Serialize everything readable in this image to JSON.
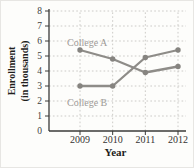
{
  "figure": {
    "background": "#fdfdfb",
    "border_color": "#e7e6e3",
    "axis_color": "#3a3a38",
    "grid_color": "#c6c5c2",
    "tick_label_color": "#403f3d",
    "axis_title_color": "#1f1e1c",
    "series_line_color": "#8e8c88",
    "marker_color": "#868480",
    "series_label_color": "#9d9b97"
  },
  "chart_data": {
    "type": "line",
    "title": "",
    "xlabel": "Year",
    "ylabel": "Enrollment (in thousands)",
    "ylabel_lines": [
      "Enrollment",
      "(in thousands)"
    ],
    "categories": [
      "2009",
      "2010",
      "2011",
      "2012"
    ],
    "series": [
      {
        "name": "College A",
        "values": [
          5.4,
          4.8,
          3.9,
          4.3
        ],
        "color": "#8e8c88"
      },
      {
        "name": "College B",
        "values": [
          3.0,
          3.0,
          4.9,
          5.4
        ],
        "color": "#8e8c88"
      }
    ],
    "ylim": [
      0,
      8
    ],
    "yticks": [
      0,
      1,
      2,
      3,
      4,
      5,
      6,
      7,
      8
    ],
    "ytick_step": 1,
    "grid": "dotted",
    "legend_position": "inline-labels",
    "marker": "circle"
  }
}
